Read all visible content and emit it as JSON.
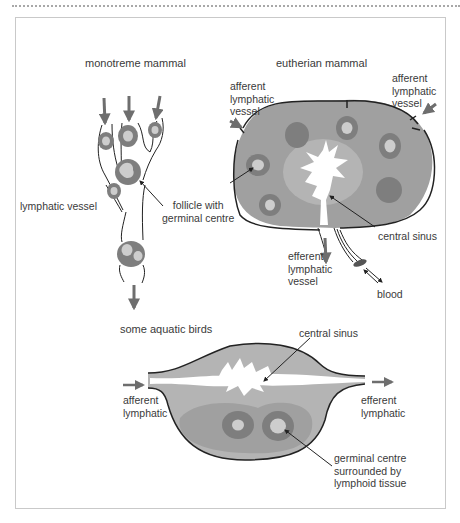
{
  "diagram": {
    "colors": {
      "outline": "#222222",
      "arrow": "#6e6e6e",
      "tissue_light": "#b4b4b4",
      "tissue_mid": "#a0a0a0",
      "follicle_ring": "#7e7e7e",
      "germinal_centre": "#cdcdcd",
      "sinus": "#ffffff",
      "frame_border": "#c9c9c9",
      "text": "#3a3a3a"
    },
    "panels": [
      {
        "id": "monotreme",
        "heading": "monotreme mammal",
        "labels": {
          "lymphatic_vessel": "lymphatic vessel",
          "follicle": "follicle with\ngerminal centre"
        }
      },
      {
        "id": "eutherian",
        "heading": "eutherian mammal",
        "labels": {
          "afferent_left": "afferent\nlymphatic\nvessel",
          "afferent_right": "afferent\nlymphatic\nvessel",
          "central_sinus": "central sinus",
          "efferent": "efferent\nlymphatic\nvessel",
          "blood": "blood"
        }
      },
      {
        "id": "aquatic_birds",
        "heading": "some aquatic birds",
        "labels": {
          "central_sinus": "central sinus",
          "afferent": "afferent\nlymphatic",
          "efferent": "efferent\nlymphatic",
          "germinal": "germinal centre\nsurrounded by\nlymphoid tissue"
        }
      }
    ]
  }
}
